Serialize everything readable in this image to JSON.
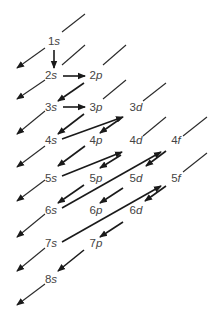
{
  "diagram": {
    "line_color": "#2a2a2a",
    "label_color": "#444444",
    "orbitals": [
      {
        "id": "1s",
        "n": "1",
        "l": "s",
        "x": 54,
        "y": 45
      },
      {
        "id": "2s",
        "n": "2",
        "l": "s",
        "x": 51,
        "y": 79
      },
      {
        "id": "2p",
        "n": "2",
        "l": "p",
        "x": 96,
        "y": 79
      },
      {
        "id": "3s",
        "n": "3",
        "l": "s",
        "x": 51,
        "y": 111
      },
      {
        "id": "3p",
        "n": "3",
        "l": "p",
        "x": 96,
        "y": 111
      },
      {
        "id": "3d",
        "n": "3",
        "l": "d",
        "x": 136,
        "y": 111
      },
      {
        "id": "4s",
        "n": "4",
        "l": "s",
        "x": 51,
        "y": 144
      },
      {
        "id": "4p",
        "n": "4",
        "l": "p",
        "x": 96,
        "y": 144
      },
      {
        "id": "4d",
        "n": "4",
        "l": "d",
        "x": 136,
        "y": 144
      },
      {
        "id": "4f",
        "n": "4",
        "l": "f",
        "x": 176,
        "y": 144
      },
      {
        "id": "5s",
        "n": "5",
        "l": "s",
        "x": 51,
        "y": 182
      },
      {
        "id": "5p",
        "n": "5",
        "l": "p",
        "x": 96,
        "y": 182
      },
      {
        "id": "5d",
        "n": "5",
        "l": "d",
        "x": 136,
        "y": 182
      },
      {
        "id": "5f",
        "n": "5",
        "l": "f",
        "x": 176,
        "y": 182
      },
      {
        "id": "6s",
        "n": "6",
        "l": "s",
        "x": 51,
        "y": 214
      },
      {
        "id": "6p",
        "n": "6",
        "l": "p",
        "x": 96,
        "y": 214
      },
      {
        "id": "6d",
        "n": "6",
        "l": "d",
        "x": 136,
        "y": 214
      },
      {
        "id": "7s",
        "n": "7",
        "l": "s",
        "x": 51,
        "y": 247
      },
      {
        "id": "7p",
        "n": "7",
        "l": "p",
        "x": 96,
        "y": 247
      },
      {
        "id": "8s",
        "n": "8",
        "l": "s",
        "x": 51,
        "y": 283
      }
    ],
    "filling_order": [
      "1s",
      "2s",
      "2p",
      "3s",
      "3p",
      "4s",
      "3d",
      "4p",
      "5s",
      "4d",
      "5p",
      "6s",
      "4f",
      "5d",
      "6p",
      "7s",
      "5f",
      "6d",
      "7p",
      "8s"
    ],
    "arrows": [
      {
        "x1": 54,
        "y1": 50,
        "x2": 54,
        "y2": 68
      },
      {
        "x1": 63,
        "y1": 76,
        "x2": 85,
        "y2": 76
      },
      {
        "x1": 84,
        "y1": 83,
        "x2": 58,
        "y2": 101
      },
      {
        "x1": 63,
        "y1": 107,
        "x2": 85,
        "y2": 107
      },
      {
        "x1": 84,
        "y1": 114,
        "x2": 58,
        "y2": 134
      },
      {
        "x1": 62,
        "y1": 139,
        "x2": 123,
        "y2": 117
      },
      {
        "x1": 120,
        "y1": 119,
        "x2": 100,
        "y2": 133
      },
      {
        "x1": 85,
        "y1": 146,
        "x2": 58,
        "y2": 166
      },
      {
        "x1": 62,
        "y1": 176,
        "x2": 122,
        "y2": 152
      },
      {
        "x1": 121,
        "y1": 155,
        "x2": 100,
        "y2": 168
      },
      {
        "x1": 84,
        "y1": 185,
        "x2": 58,
        "y2": 203
      },
      {
        "x1": 62,
        "y1": 208,
        "x2": 161,
        "y2": 152
      },
      {
        "x1": 166,
        "y1": 151,
        "x2": 146,
        "y2": 166
      },
      {
        "x1": 123,
        "y1": 188,
        "x2": 100,
        "y2": 203
      },
      {
        "x1": 62,
        "y1": 242,
        "x2": 161,
        "y2": 186
      },
      {
        "x1": 166,
        "y1": 186,
        "x2": 145,
        "y2": 201
      },
      {
        "x1": 123,
        "y1": 222,
        "x2": 100,
        "y2": 237
      },
      {
        "x1": 84,
        "y1": 250,
        "x2": 58,
        "y2": 271
      }
    ],
    "guide_lines": [
      {
        "x1": 85,
        "y1": 14,
        "x2": 62,
        "y2": 32
      },
      {
        "x1": 45,
        "y1": 48,
        "x2": 17,
        "y2": 68
      },
      {
        "x1": 85,
        "y1": 45,
        "x2": 62,
        "y2": 65
      },
      {
        "x1": 45,
        "y1": 80,
        "x2": 17,
        "y2": 99
      },
      {
        "x1": 126,
        "y1": 45,
        "x2": 103,
        "y2": 65
      },
      {
        "x1": 126,
        "y1": 80,
        "x2": 103,
        "y2": 99
      },
      {
        "x1": 45,
        "y1": 111,
        "x2": 17,
        "y2": 134
      },
      {
        "x1": 166,
        "y1": 83,
        "x2": 143,
        "y2": 101
      },
      {
        "x1": 45,
        "y1": 146,
        "x2": 17,
        "y2": 167
      },
      {
        "x1": 166,
        "y1": 117,
        "x2": 143,
        "y2": 136
      },
      {
        "x1": 207,
        "y1": 117,
        "x2": 183,
        "y2": 136
      },
      {
        "x1": 45,
        "y1": 180,
        "x2": 17,
        "y2": 201
      },
      {
        "x1": 207,
        "y1": 153,
        "x2": 183,
        "y2": 172
      },
      {
        "x1": 45,
        "y1": 214,
        "x2": 17,
        "y2": 237
      },
      {
        "x1": 45,
        "y1": 248,
        "x2": 17,
        "y2": 271
      },
      {
        "x1": 45,
        "y1": 284,
        "x2": 17,
        "y2": 305
      }
    ]
  }
}
